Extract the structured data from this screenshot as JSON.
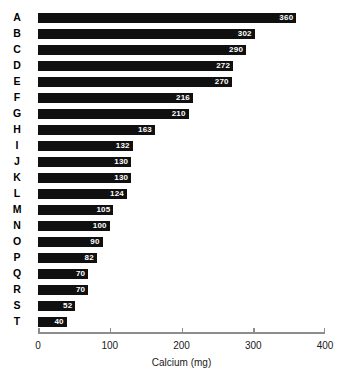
{
  "chart_data": {
    "type": "bar",
    "orientation": "horizontal",
    "title": "",
    "subtitle": "",
    "xlabel": "Calcium (mg)",
    "ylabel": "",
    "xlim": [
      0,
      400
    ],
    "ylim": null,
    "grid": false,
    "legend": null,
    "bar_color": "#101010",
    "axis_color": "#8d8d8d",
    "value_label_color": "#ffffff",
    "value_labels_inside_bars": true,
    "xticks": [
      0,
      100,
      200,
      300,
      400
    ],
    "xtick_labels": [
      "0",
      "100",
      "200",
      "300",
      "400"
    ],
    "categories": [
      "A",
      "B",
      "C",
      "D",
      "E",
      "F",
      "G",
      "H",
      "I",
      "J",
      "K",
      "L",
      "M",
      "N",
      "O",
      "P",
      "Q",
      "R",
      "S",
      "T"
    ],
    "values": [
      360,
      302,
      290,
      272,
      270,
      216,
      210,
      163,
      132,
      130,
      130,
      124,
      105,
      100,
      90,
      82,
      70,
      70,
      52,
      40
    ],
    "value_labels": [
      "360",
      "302",
      "290",
      "272",
      "270",
      "216",
      "210",
      "163",
      "132",
      "130",
      "130",
      "124",
      "105",
      "100",
      "90",
      "82",
      "70",
      "70",
      "52",
      "40"
    ],
    "bars": [
      {
        "category": "A",
        "value": 360,
        "label": "360"
      },
      {
        "category": "B",
        "value": 302,
        "label": "302"
      },
      {
        "category": "C",
        "value": 290,
        "label": "290"
      },
      {
        "category": "D",
        "value": 272,
        "label": "272"
      },
      {
        "category": "E",
        "value": 270,
        "label": "270"
      },
      {
        "category": "F",
        "value": 216,
        "label": "216"
      },
      {
        "category": "G",
        "value": 210,
        "label": "210"
      },
      {
        "category": "H",
        "value": 163,
        "label": "163"
      },
      {
        "category": "I",
        "value": 132,
        "label": "132"
      },
      {
        "category": "J",
        "value": 130,
        "label": "130"
      },
      {
        "category": "K",
        "value": 130,
        "label": "130"
      },
      {
        "category": "L",
        "value": 124,
        "label": "124"
      },
      {
        "category": "M",
        "value": 105,
        "label": "105"
      },
      {
        "category": "N",
        "value": 100,
        "label": "100"
      },
      {
        "category": "O",
        "value": 90,
        "label": "90"
      },
      {
        "category": "P",
        "value": 82,
        "label": "82"
      },
      {
        "category": "Q",
        "value": 70,
        "label": "70"
      },
      {
        "category": "R",
        "value": 70,
        "label": "70"
      },
      {
        "category": "S",
        "value": 52,
        "label": "52"
      },
      {
        "category": "T",
        "value": 40,
        "label": "40"
      }
    ]
  }
}
